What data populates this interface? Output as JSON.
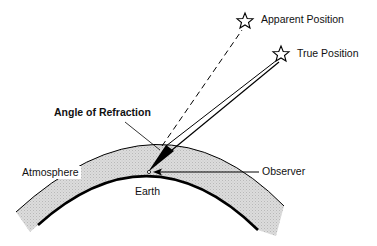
{
  "diagram": {
    "labels": {
      "apparent_position": "Apparent Position",
      "true_position": "True Position",
      "angle_of_refraction": "Angle of Refraction",
      "atmosphere": "Atmosphere",
      "observer": "Observer",
      "earth": "Earth"
    },
    "colors": {
      "atmosphere_fill": "#d9d9d9",
      "line": "#000000",
      "background": "#ffffff"
    },
    "elements": [
      {
        "id": "apparent-star",
        "kind": "star",
        "label_ref": "apparent_position"
      },
      {
        "id": "true-star",
        "kind": "star",
        "label_ref": "true_position"
      },
      {
        "id": "apparent-ray",
        "kind": "dashed-line",
        "from": "observer",
        "to": "apparent-star"
      },
      {
        "id": "true-rays",
        "kind": "double-line",
        "from": "observer",
        "to": "true-star"
      },
      {
        "id": "refraction-wedge",
        "kind": "filled-wedge",
        "label_ref": "angle_of_refraction"
      },
      {
        "id": "atmosphere-band",
        "kind": "shaded-arc",
        "label_ref": "atmosphere"
      },
      {
        "id": "earth-surface",
        "kind": "thick-arc",
        "label_ref": "earth"
      },
      {
        "id": "observer-point",
        "kind": "point-with-arrow",
        "label_ref": "observer"
      }
    ]
  }
}
